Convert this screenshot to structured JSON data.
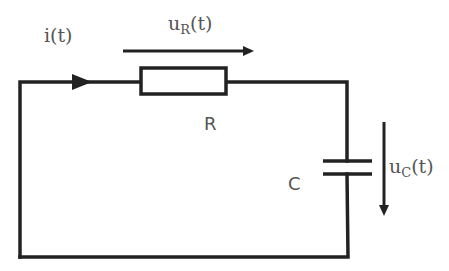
{
  "diagram": {
    "type": "RC series circuit",
    "labels": {
      "current": "i(t)",
      "resistor_voltage_main": "u",
      "resistor_voltage_sub": "R",
      "resistor_voltage_tail": "(t)",
      "resistor": "R",
      "capacitor": "C",
      "capacitor_voltage_main": "u",
      "capacitor_voltage_sub": "C",
      "capacitor_voltage_tail": "(t)"
    },
    "components": [
      {
        "id": "resistor",
        "name": "R"
      },
      {
        "id": "capacitor",
        "name": "C"
      }
    ],
    "colors": {
      "wire": "#222222",
      "label": "#555555",
      "background": "#ffffff"
    }
  }
}
